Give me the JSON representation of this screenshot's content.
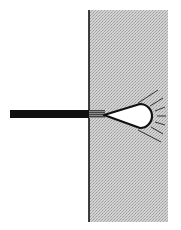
{
  "figure": {
    "colors": {
      "background": "#ffffff",
      "medium_fill": "#c8c8c8",
      "ink": "#111111",
      "cavity_fill": "#ffffff"
    },
    "parts": [
      {
        "name": "rod",
        "label": ""
      },
      {
        "name": "medium",
        "label": ""
      },
      {
        "name": "interface-line",
        "label": ""
      },
      {
        "name": "hatched-segment",
        "label": ""
      },
      {
        "name": "teardrop-cavity",
        "label": ""
      },
      {
        "name": "radiating-lines",
        "count": 7
      }
    ]
  }
}
